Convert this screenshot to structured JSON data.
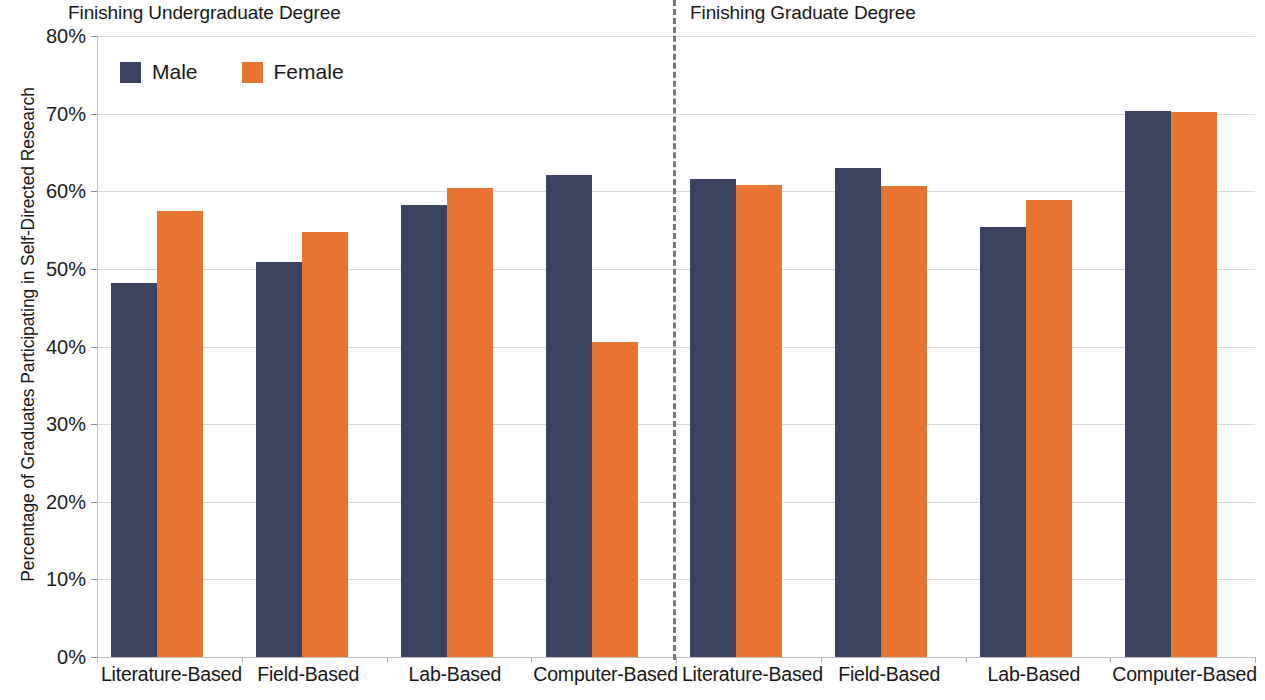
{
  "chart_data": {
    "type": "bar",
    "title": "",
    "xlabel": "",
    "ylabel": "Percentage of Graduates Participating in Self-Directed Research",
    "ylim": [
      0,
      80
    ],
    "ytick_labels": [
      "80%",
      "70%",
      "60%",
      "50%",
      "40%",
      "30%",
      "20%",
      "10%",
      "0%"
    ],
    "ytick_values": [
      80,
      70,
      60,
      50,
      40,
      30,
      20,
      10,
      0
    ],
    "grid": true,
    "legend_position": "top-left",
    "legend": [
      "Male",
      "Female"
    ],
    "panels": [
      {
        "title": "Finishing Undergraduate Degree",
        "categories": [
          "Literature-Based",
          "Field-Based",
          "Lab-Based",
          "Computer-Based"
        ],
        "series": [
          {
            "name": "Male",
            "values": [
              48.2,
              50.9,
              58.2,
              62.1
            ]
          },
          {
            "name": "Female",
            "values": [
              57.4,
              54.8,
              60.4,
              40.6
            ]
          }
        ]
      },
      {
        "title": "Finishing Graduate Degree",
        "categories": [
          "Literature-Based",
          "Field-Based",
          "Lab-Based",
          "Computer-Based"
        ],
        "series": [
          {
            "name": "Male",
            "values": [
              61.6,
              63.0,
              55.4,
              70.4
            ]
          },
          {
            "name": "Female",
            "values": [
              60.8,
              60.7,
              58.9,
              70.2
            ]
          }
        ]
      }
    ],
    "colors": {
      "male": "#3a4161",
      "female": "#e87432",
      "gridline": "#d9d9d9",
      "divider": "#777777",
      "text": "#171717"
    }
  }
}
